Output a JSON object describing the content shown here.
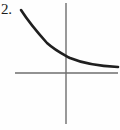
{
  "figure": {
    "problem_number": "2.",
    "canvas": {
      "width": 120,
      "height": 130
    },
    "background_color": "#fefefe",
    "axis_color": "#6e6e6e",
    "curve_color": "#1f1f1f",
    "label_color": "#1c1c1c",
    "axes": {
      "x_axis": {
        "y": 73,
        "x_start": 15,
        "x_end": 118,
        "stroke_width": 1.4
      },
      "y_axis": {
        "x": 66,
        "y_start": 3,
        "y_end": 124,
        "stroke_width": 1.4
      },
      "origin": {
        "x": 66,
        "y": 73
      },
      "ticks": false,
      "tick_labels": false,
      "grid": false,
      "x_axis_label": "",
      "y_axis_label": ""
    },
    "curve": {
      "stroke_width": 2.6,
      "path": "M 21 10 C 30 24, 38 33, 47 43 C 56 51, 61 53, 70 58 C 82 63, 98 66, 118 67"
    }
  },
  "chart_data": {
    "type": "line",
    "title": "",
    "subtitle": "",
    "xlabel": "",
    "ylabel": "",
    "grid": false,
    "legend": null,
    "annotations": [
      "2."
    ],
    "xlim": [
      -3.4,
      2.6
    ],
    "ylim": [
      -2.6,
      1.8
    ],
    "series": [
      {
        "name": "exponential decay",
        "x": [
          -3.4,
          -3.0,
          -2.6,
          -2.2,
          -1.8,
          -1.4,
          -1.0,
          -0.6,
          -0.2,
          0.2,
          0.6,
          1.0,
          1.4,
          1.8,
          2.2,
          2.6
        ],
        "y": [
          1.62,
          1.42,
          1.22,
          1.02,
          0.85,
          0.7,
          0.57,
          0.47,
          0.39,
          0.32,
          0.27,
          0.23,
          0.2,
          0.18,
          0.16,
          0.15
        ]
      }
    ]
  }
}
